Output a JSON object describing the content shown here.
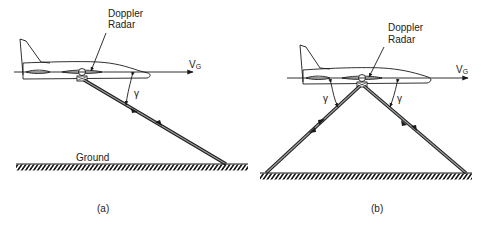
{
  "figure": {
    "panel_a": {
      "caption": "(a)",
      "radar_label_line1": "Doppler",
      "radar_label_line2": "Radar",
      "velocity_label": "V",
      "velocity_subscript": "G",
      "angle_label": "γ",
      "ground_label": "Ground"
    },
    "panel_b": {
      "caption": "(b)",
      "radar_label_line1": "Doppler",
      "radar_label_line2": "Radar",
      "velocity_label": "V",
      "velocity_subscript": "G",
      "angle_label_left": "γ",
      "angle_label_right": "γ"
    },
    "colors": {
      "line": "#1a1a1a",
      "beam_fill": "#9a9a9a",
      "background": "#ffffff"
    }
  }
}
